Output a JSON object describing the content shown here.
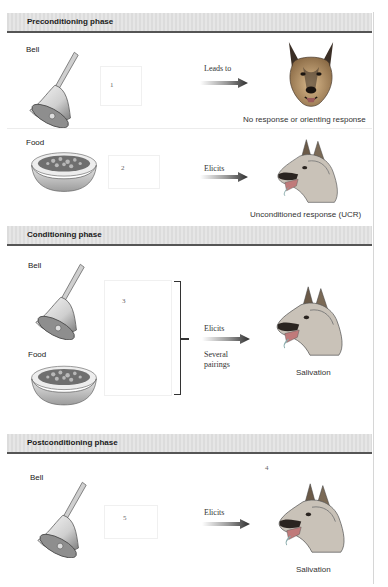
{
  "figure": {
    "phases": [
      {
        "title": "Preconditioning phase",
        "rows": [
          {
            "stimulus": "Bell",
            "stimulus_icon": "bell-icon",
            "number": "1",
            "arrow_label": "Leads to",
            "response_icon": "dog-head-front-icon",
            "response_caption": "No response or orienting response"
          },
          {
            "stimulus": "Food",
            "stimulus_icon": "food-bowl-icon",
            "number": "2",
            "arrow_label": "Elicits",
            "response_icon": "dog-head-salivating-icon",
            "response_caption": "Unconditioned response (UCR)"
          }
        ]
      },
      {
        "title": "Conditioning phase",
        "stimuli": [
          {
            "label": "Bell",
            "icon": "bell-icon"
          },
          {
            "label": "Food",
            "icon": "food-bowl-icon"
          }
        ],
        "number": "3",
        "arrow_label_top": "Elicits",
        "arrow_label_bottom": "Several pairings",
        "response_icon": "dog-head-salivating-icon",
        "response_caption": "Salivation"
      },
      {
        "title": "Postconditioning phase",
        "number_top": "4",
        "stimulus": "Bell",
        "stimulus_icon": "bell-icon",
        "number": "5",
        "arrow_label": "Elicits",
        "response_icon": "dog-head-salivating-icon",
        "response_caption": "Salivation"
      }
    ]
  },
  "colors": {
    "header_bg": "#e0e0e0",
    "header_rule": "#555555",
    "arrow_dark": "#3a3a3a",
    "dog_tan": "#c9a77a",
    "dog_dark": "#3b2f26"
  }
}
